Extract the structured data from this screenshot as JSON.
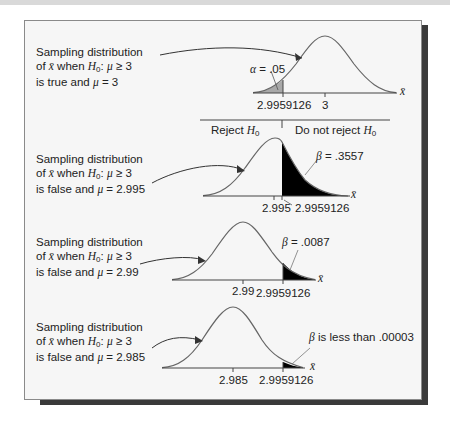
{
  "panels": [
    {
      "caption_lines": [
        "Sampling distribution",
        "of x̄ when H0: μ ≥ 3",
        "is true and μ = 3"
      ],
      "caption": {
        "line1": "Sampling distribution",
        "line2_pre": "of ",
        "xbar": "x̄",
        "line2_mid": " when ",
        "H": "H",
        "sub0": "0",
        "line2_post": ": ",
        "mu": "μ",
        "cond": " ≥ 3",
        "line3_pre": "is true and ",
        "line3_eq": " = 3"
      },
      "annotation": {
        "symbol": "α",
        "text": " = .05"
      },
      "ticks": [
        "2.9959126",
        "3"
      ],
      "axis_label": "x̄"
    },
    {
      "caption": {
        "line1": "Sampling distribution",
        "line2_pre": "of ",
        "xbar": "x̄",
        "line2_mid": " when ",
        "H": "H",
        "sub0": "0",
        "line2_post": ": ",
        "mu": "μ",
        "cond": " ≥ 3",
        "line3_pre": "is false and ",
        "line3_eq": " = 2.995"
      },
      "annotation": {
        "symbol": "β",
        "text": " = .3557"
      },
      "ticks": [
        "2.995",
        "2.9959126"
      ],
      "axis_label": "x̄"
    },
    {
      "caption": {
        "line1": "Sampling distribution",
        "line2_pre": "of ",
        "xbar": "x̄",
        "line2_mid": " when ",
        "H": "H",
        "sub0": "0",
        "line2_post": ": ",
        "mu": "μ",
        "cond": " ≥ 3",
        "line3_pre": "is false and ",
        "line3_eq": " = 2.99"
      },
      "annotation": {
        "symbol": "β",
        "text": " = .0087"
      },
      "ticks": [
        "2.99",
        "2.9959126"
      ],
      "axis_label": "x̄"
    },
    {
      "caption": {
        "line1": "Sampling distribution",
        "line2_pre": "of ",
        "xbar": "x̄",
        "line2_mid": " when ",
        "H": "H",
        "sub0": "0",
        "line2_post": ": ",
        "mu": "μ",
        "cond": " ≥ 3",
        "line3_pre": "is false and ",
        "line3_eq": " = 2.985"
      },
      "annotation": {
        "symbol": "β",
        "text": " is less than .00003"
      },
      "ticks": [
        "2.985",
        "2.9959126"
      ],
      "axis_label": "x̄"
    }
  ],
  "decision": {
    "reject": {
      "pre": "Reject ",
      "H": "H",
      "sub": "0"
    },
    "not_reject": {
      "pre": "Do not reject ",
      "H": "H",
      "sub": "0"
    }
  },
  "colors": {
    "alpha_fill": "#a8a8a8",
    "beta_fill": "#000000",
    "curve": "#555555",
    "shadow": "#3a3a3a"
  }
}
